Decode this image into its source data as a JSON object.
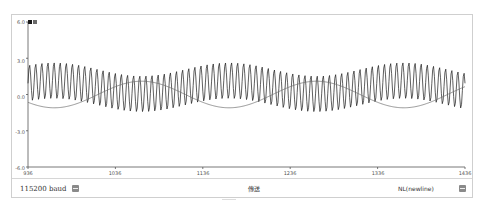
{
  "window": {
    "title": ""
  },
  "legend": {
    "colors": [
      "#1a1a1a",
      "#6b6b6b"
    ]
  },
  "bottom_bar": {
    "baud_label": "115200 baud",
    "message_placeholder": "",
    "send_label": "傳送",
    "line_ending_label": "NL(newline)"
  },
  "chart_data": {
    "type": "line",
    "title": "",
    "xlabel": "",
    "ylabel": "",
    "x_ticks": [
      "936",
      "1036",
      "1136",
      "1236",
      "1336",
      "1436"
    ],
    "y_ticks": [
      "6.0",
      "3.0",
      "0.0",
      "-3.0",
      "-6.0"
    ],
    "xlim": [
      936,
      1436
    ],
    "ylim": [
      -6,
      6
    ],
    "grid": false,
    "legend_position": "top-left",
    "series": [
      {
        "name": "fast",
        "description": "high-frequency sine (~period 7 samples) with slowly varying offset",
        "amplitude": 1.5,
        "period_samples": 7
      },
      {
        "name": "slow",
        "description": "low-frequency sine (~period 200 samples)",
        "amplitude": 1.1,
        "period_samples": 200
      }
    ]
  }
}
